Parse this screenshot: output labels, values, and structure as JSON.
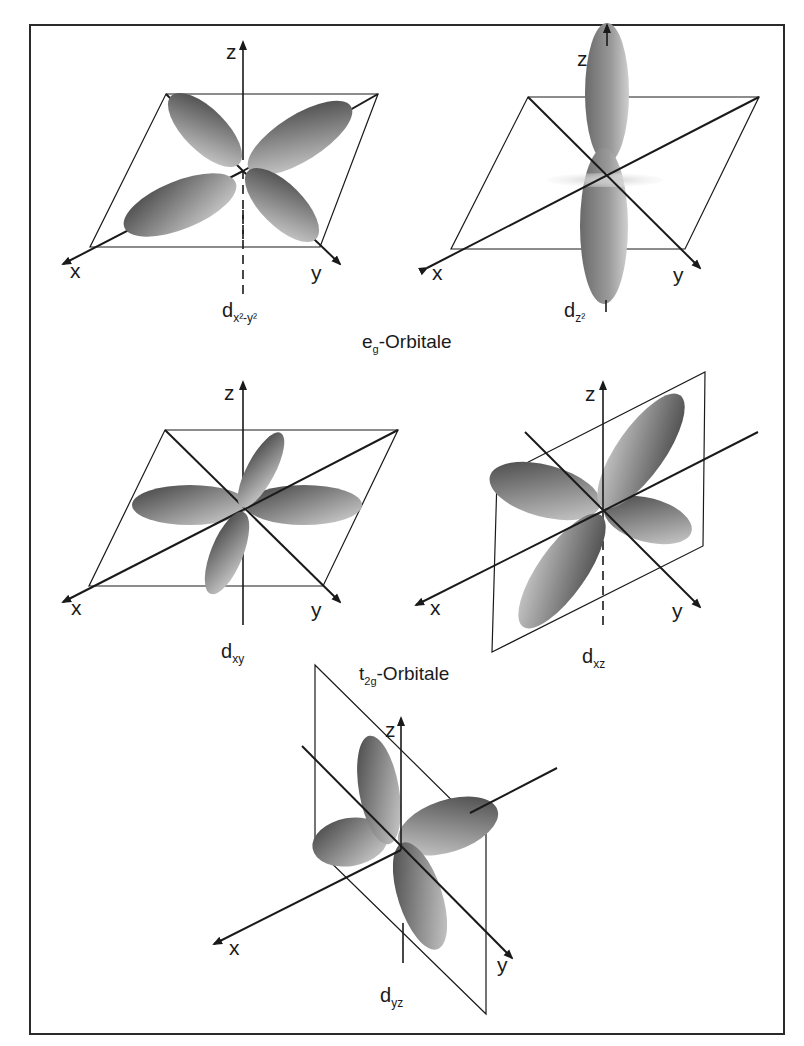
{
  "figure": {
    "groups": {
      "eg": {
        "main": "e",
        "sub": "g",
        "suffix": "-Orbitale"
      },
      "t2g": {
        "main": "t",
        "sub": "2g",
        "suffix": "-Orbitale"
      }
    },
    "orbitals": [
      {
        "id": "dx2-y2",
        "main": "d",
        "sub": "x²-y²",
        "group": "eg"
      },
      {
        "id": "dz2",
        "main": "d",
        "sub": "z²",
        "group": "eg"
      },
      {
        "id": "dxy",
        "main": "d",
        "sub": "xy",
        "group": "t2g"
      },
      {
        "id": "dxz",
        "main": "d",
        "sub": "xz",
        "group": "t2g"
      },
      {
        "id": "dyz",
        "main": "d",
        "sub": "yz",
        "group": "t2g"
      }
    ],
    "axes": {
      "x": "x",
      "y": "y",
      "z": "z"
    }
  },
  "colors": {
    "line": "#1a1a1a",
    "lobe_dark": "#4a4a4a",
    "lobe_light": "#d0d0d0",
    "frame": "#2a2a2a"
  }
}
